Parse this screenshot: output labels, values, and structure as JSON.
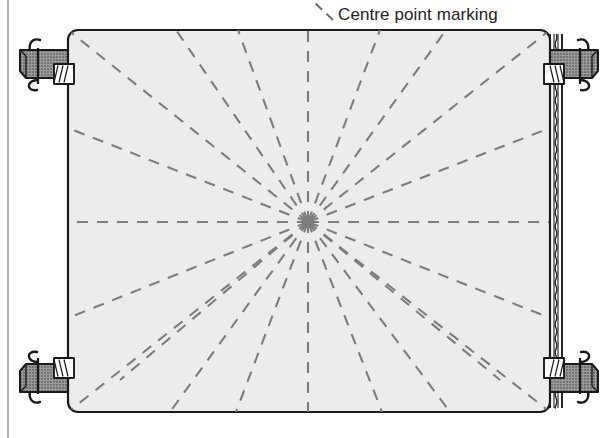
{
  "figure": {
    "kind": "technical-illustration",
    "background_color": "#ffffff"
  },
  "annotations": [
    {
      "id": "centre-point-marking",
      "text": "Centre point marking",
      "x": 338,
      "y": 6,
      "color": "#232323",
      "leader": {
        "style": "dashed",
        "from_x": 333,
        "from_y": 20,
        "to_x": 314,
        "to_y": 2
      }
    }
  ],
  "panel": {
    "name": "work-panel",
    "x": 68,
    "y": 30,
    "width": 482,
    "height": 382,
    "corner_radius": 10,
    "fill_color": "#ececec",
    "stroke_color": "#1a1a1a",
    "stroke_width": 2.2
  },
  "hemmed_edge": {
    "name": "panel-right-hem",
    "description": "Rolled / stitched seam along the right edge of the panel",
    "x": 550,
    "top_y": 34,
    "bottom_y": 408,
    "line_offsets": [
      0,
      4,
      8,
      12
    ],
    "wave_offset": 6,
    "wave_period": 7,
    "wave_amplitude": 1.6,
    "stroke_color": "#1a1a1a"
  },
  "centre_point": {
    "name": "centre-point",
    "x": 308,
    "y": 222,
    "label_ref": "centre-point-marking"
  },
  "marking_lines": {
    "name": "radial-marking-lines",
    "style": "dashed",
    "stroke_color": "#7d7d7d",
    "stroke_width": 2.1,
    "dash_pattern": "11 9",
    "count": 22,
    "endpoints": [
      {
        "x": 68,
        "y": 222
      },
      {
        "x": 68,
        "y": 128
      },
      {
        "x": 68,
        "y": 30
      },
      {
        "x": 176,
        "y": 30
      },
      {
        "x": 238,
        "y": 30
      },
      {
        "x": 308,
        "y": 30
      },
      {
        "x": 380,
        "y": 30
      },
      {
        "x": 446,
        "y": 30
      },
      {
        "x": 550,
        "y": 30
      },
      {
        "x": 550,
        "y": 128
      },
      {
        "x": 550,
        "y": 222
      },
      {
        "x": 550,
        "y": 318
      },
      {
        "x": 550,
        "y": 412
      },
      {
        "x": 450,
        "y": 412
      },
      {
        "x": 382,
        "y": 412
      },
      {
        "x": 308,
        "y": 412
      },
      {
        "x": 236,
        "y": 412
      },
      {
        "x": 170,
        "y": 412
      },
      {
        "x": 68,
        "y": 412
      },
      {
        "x": 68,
        "y": 318
      },
      {
        "x": 120,
        "y": 380
      },
      {
        "x": 500,
        "y": 380
      }
    ]
  },
  "clamps": [
    {
      "id": "clamp-top-left",
      "name": "corner-clamp-top-left",
      "cx": 44,
      "cy": 62,
      "flip_x": false,
      "flip_y": false
    },
    {
      "id": "clamp-top-right",
      "name": "corner-clamp-top-right",
      "cx": 574,
      "cy": 62,
      "flip_x": true,
      "flip_y": false
    },
    {
      "id": "clamp-bottom-left",
      "name": "corner-clamp-bottom-left",
      "cx": 44,
      "cy": 380,
      "flip_x": false,
      "flip_y": true
    },
    {
      "id": "clamp-bottom-right",
      "name": "corner-clamp-bottom-right",
      "cx": 574,
      "cy": 380,
      "flip_x": true,
      "flip_y": true
    }
  ],
  "clamp_style": {
    "body_fill": "#9a9a9a",
    "body_stroke": "#1a1a1a",
    "jaw_fill": "#ffffff",
    "jaw_stroke": "#1a1a1a",
    "wire_stroke": "#1a1a1a",
    "hatch_color": "#4d4d4d"
  },
  "frame_border": {
    "name": "figure-left-border",
    "x": 8,
    "top_y": 0,
    "bottom_y": 438,
    "stroke_color": "#8e8e8e",
    "stroke_width": 1.4
  }
}
